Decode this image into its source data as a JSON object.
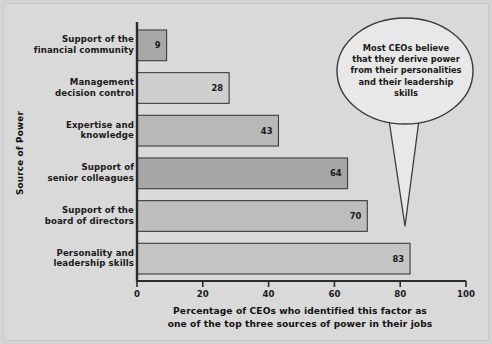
{
  "figure": {
    "background_color": "#d9d9d9",
    "axis_color": "#2b2b2b"
  },
  "chart_data": {
    "type": "bar",
    "orientation": "horizontal",
    "title": "",
    "xlabel_line1": "Percentage of CEOs who identified this factor as",
    "xlabel_line2": "one of the top three sources of power in their jobs",
    "ylabel": "Source of Power",
    "categories": [
      "Support of the\nfinancial community",
      "Management\ndecision control",
      "Expertise and\nknowledge",
      "Support of\nsenior colleagues",
      "Support of the\nboard of directors",
      "Personality and\nleadership skills"
    ],
    "category_lines": [
      [
        "Support of the",
        "financial community"
      ],
      [
        "Management",
        "decision control"
      ],
      [
        "Expertise and",
        "knowledge"
      ],
      [
        "Support of",
        "senior colleagues"
      ],
      [
        "Support of the",
        "board of directors"
      ],
      [
        "Personality and",
        "leadership skills"
      ]
    ],
    "values": [
      9,
      28,
      43,
      64,
      70,
      83
    ],
    "value_labels": [
      "9",
      "28",
      "43",
      "64",
      "70",
      "83"
    ],
    "bar_colors": [
      "#a8a8a8",
      "#cfcfcf",
      "#b8b8b8",
      "#a6a6a6",
      "#bdbdbd",
      "#c4c4c4"
    ],
    "xlim": [
      0,
      100
    ],
    "xticks": [
      0,
      20,
      40,
      60,
      80,
      100
    ],
    "xtick_labels": [
      "0",
      "20",
      "40",
      "60",
      "80",
      "100"
    ],
    "grid": false,
    "legend": false
  },
  "callout": {
    "lines": [
      "Most CEOs believe",
      "that they derive power",
      "from their personalities",
      "and their leadership",
      "skills"
    ],
    "text": "Most CEOs believe that they derive power from their personalities and their leadership skills",
    "points_to_category": "Personality and leadership skills",
    "points_to_value": 83,
    "fill_color": "#e8e8e8",
    "border_color": "#3a3a3a"
  }
}
